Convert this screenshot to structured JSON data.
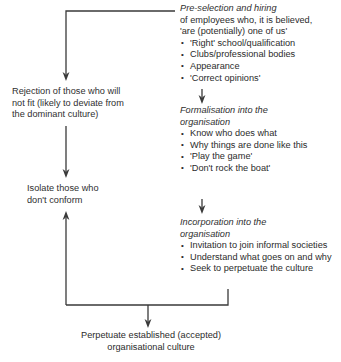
{
  "diagram": {
    "line_color": "#3a3a3a",
    "text_color": "#2f2f2f",
    "background": "#ffffff",
    "stages": [
      {
        "id": "pre-selection",
        "heading_line_1": "Pre-selection and hiring",
        "heading_line_2": "of employees who, it is believed,",
        "heading_line_3": "'are (potentially) one of us'",
        "bullets": [
          "'Right' school/qualification",
          "Clubs/professional bodies",
          "Appearance",
          "'Correct opinions'"
        ]
      },
      {
        "id": "formalisation",
        "heading_line_1": "Formalisation into the",
        "heading_line_2": "organisation",
        "bullets": [
          "Know who does what",
          "Why things are done like this",
          "'Play the game'",
          "'Don't rock the boat'"
        ]
      },
      {
        "id": "incorporation",
        "heading_line_1": "Incorporation into the",
        "heading_line_2": "organisation",
        "bullets": [
          "Invitation to join informal societies",
          "Understand what goes on and why",
          "Seek to perpetuate the culture"
        ]
      }
    ],
    "left_nodes": [
      {
        "id": "rejection",
        "line_1": "Rejection of those who will",
        "line_2": "not fit (likely to deviate from",
        "line_3": "the dominant culture)"
      },
      {
        "id": "isolate",
        "line_1": "Isolate those who",
        "line_2": "don't conform"
      }
    ],
    "outcome": {
      "id": "perpetuate",
      "line_1": "Perpetuate established (accepted)",
      "line_2": "organisational culture"
    }
  }
}
